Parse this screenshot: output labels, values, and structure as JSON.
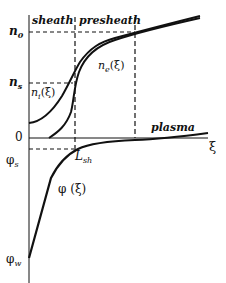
{
  "diagram": {
    "region_labels": {
      "sheath": "sheath",
      "presheath": "presheath",
      "plasma": "plasma"
    },
    "y_axis_labels": {
      "n0": "n",
      "n0_sub": "0",
      "ns": "n",
      "ns_sub": "s",
      "zero": "0",
      "phi_s": "φ",
      "phi_s_sub": "s",
      "phi_w": "φ",
      "phi_w_sub": "w"
    },
    "x_axis_label": "ξ",
    "curve_labels": {
      "ion_density": "n",
      "ion_density_sub": "i",
      "ion_density_arg": "(ξ)",
      "electron_density": "n",
      "electron_density_sub": "e",
      "electron_density_arg": "(ξ)",
      "potential": "φ (ξ)"
    },
    "sheath_length_label": "L",
    "sheath_length_sub": "sh",
    "colors": {
      "ink": "#111111",
      "background": "#ffffff"
    }
  }
}
